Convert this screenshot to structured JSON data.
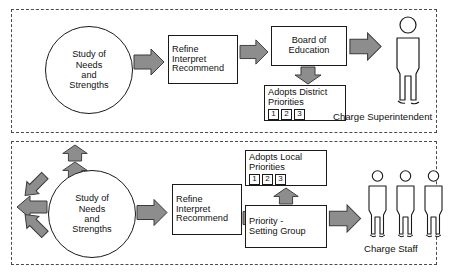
{
  "diagram": {
    "colors": {
      "arrow_fill": "#8d8d8d",
      "arrow_stroke": "#3a3a3a",
      "box_stroke": "#1a1a1a",
      "panel_stroke": "#4a4a4a",
      "background": "#ffffff",
      "text": "#111111"
    }
  },
  "panels": [
    {
      "id": "district-level",
      "nodes": {
        "study_circle": {
          "lines": [
            "Study of",
            "Needs",
            "and",
            "Strengths"
          ]
        },
        "refine_box": {
          "lines": [
            "Refine",
            "Interpret",
            "Recommend"
          ]
        },
        "board_box": {
          "lines": [
            "Board of",
            "Education"
          ]
        },
        "adopts_box": {
          "lines": [
            "Adopts District",
            "Priorities"
          ],
          "chips": [
            "1",
            "2",
            "3"
          ]
        },
        "person": {
          "caption": "Charge Superintendent",
          "count": 1,
          "icon": "person-icon"
        }
      },
      "arrows": [
        {
          "name": "arrow-study-to-refine",
          "direction": "right"
        },
        {
          "name": "arrow-refine-to-board",
          "direction": "right"
        },
        {
          "name": "arrow-board-to-adopts",
          "direction": "down"
        },
        {
          "name": "arrow-board-to-superintendent",
          "direction": "right"
        }
      ]
    },
    {
      "id": "school-level",
      "nodes": {
        "study_circle": {
          "lines": [
            "Study of",
            "Needs",
            "and",
            "Strengths"
          ]
        },
        "refine_box": {
          "lines": [
            "Refine",
            "Interpret",
            "Recommend"
          ]
        },
        "adopts_box": {
          "lines": [
            "Adopts Local",
            "Priorities"
          ],
          "chips": [
            "1",
            "2",
            "3"
          ]
        },
        "priority_box": {
          "lines": [
            "Priority -",
            "Setting Group"
          ]
        },
        "person": {
          "caption": "Charge Staff",
          "count": 3,
          "icon": "person-icon"
        }
      },
      "arrows": [
        {
          "name": "arrow-input-up-outer",
          "direction": "up"
        },
        {
          "name": "arrow-input-up-inner",
          "direction": "up"
        },
        {
          "name": "arrow-input-upper-left",
          "direction": "up-left"
        },
        {
          "name": "arrow-input-left",
          "direction": "left"
        },
        {
          "name": "arrow-input-lower-left",
          "direction": "down-left"
        },
        {
          "name": "arrow-study-to-refine",
          "direction": "right"
        },
        {
          "name": "arrow-refine-to-priority",
          "direction": "right"
        },
        {
          "name": "arrow-priority-to-adopts",
          "direction": "up"
        },
        {
          "name": "arrow-priority-to-staff",
          "direction": "right"
        }
      ]
    }
  ]
}
